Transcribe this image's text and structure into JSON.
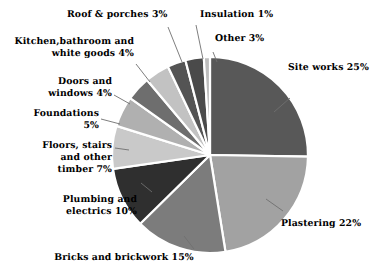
{
  "chart_data": {
    "type": "pie",
    "title": "",
    "subtitle": "",
    "xlabel": "",
    "ylabel": "",
    "legend_position": "none",
    "grid": false,
    "units": "percent",
    "start_angle_deg": 0,
    "direction": "clockwise",
    "categories": [
      "Site works",
      "Plastering",
      "Bricks and brickwork",
      "Plumbing and electrics",
      "Floors, stairs and other timber",
      "Foundations",
      "Doors and windows",
      "Kitchen,bathroom and white goods",
      "Roof & porches",
      "Other",
      "Insulation"
    ],
    "values": [
      25,
      22,
      15,
      10,
      7,
      5,
      4,
      4,
      3,
      3,
      1
    ],
    "slice_colors": [
      "#585858",
      "#a2a2a2",
      "#7c7c7c",
      "#2f2f2f",
      "#c9c9c9",
      "#b0b0b0",
      "#6e6e6e",
      "#c2c2c2",
      "#545454",
      "#4a4a4a",
      "#bdbdbd"
    ],
    "slice_separator_color": "#ffffff",
    "leader_line_color": "#6f6f6f",
    "background_color": "#ffffff",
    "text_color": "#000000"
  },
  "labels": {
    "site_works": "Site works 25%",
    "plastering": "Plastering 22%",
    "bricks": "Bricks and brickwork 15%",
    "plumbing_line1": "Plumbing and",
    "plumbing_line2": "electrics 10%",
    "floors_line1": "Floors, stairs",
    "floors_line2": "and other",
    "floors_line3": "timber 7%",
    "foundations_line1": "Foundations",
    "foundations_line2": "5%",
    "doors_line1": "Doors and",
    "doors_line2": "windows 4%",
    "kitchen_line1": "Kitchen,bathroom and",
    "kitchen_line2": "white goods 4%",
    "roof": "Roof & porches 3%",
    "insulation": "Insulation 1%",
    "other": "Other 3%"
  }
}
